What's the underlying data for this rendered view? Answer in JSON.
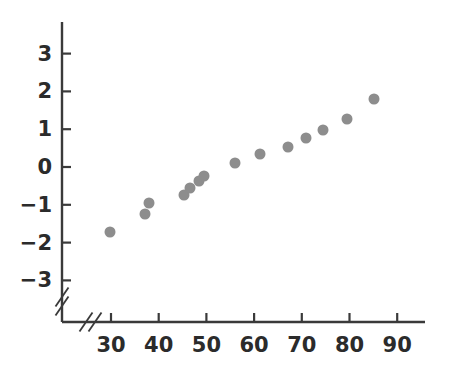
{
  "chart_data": {
    "type": "scatter",
    "title": "",
    "subtitle": "",
    "xlabel": "",
    "ylabel": "",
    "xlim": [
      26,
      94
    ],
    "ylim": [
      -3.4,
      3.4
    ],
    "xticks": [
      30,
      40,
      50,
      60,
      70,
      80,
      90
    ],
    "xtick_labels": [
      "30",
      "40",
      "50",
      "60",
      "70",
      "80",
      "90"
    ],
    "yticks": [
      3,
      2,
      1,
      0,
      -1,
      -2,
      -3
    ],
    "ytick_labels": [
      "3",
      "2",
      "1",
      "0",
      "−1",
      "−2",
      "−3"
    ],
    "grid": false,
    "legend": null,
    "axis_break": {
      "x_axis_break": true,
      "y_axis_break": true,
      "style": "double-slash"
    },
    "marker": {
      "shape": "circle",
      "color": "#8d8d8d",
      "size_px": 11
    },
    "series": [
      {
        "name": "observations",
        "points": [
          {
            "x": 29.8,
            "y": -1.72
          },
          {
            "x": 37.1,
            "y": -1.24
          },
          {
            "x": 38.0,
            "y": -0.95
          },
          {
            "x": 45.3,
            "y": -0.74
          },
          {
            "x": 46.6,
            "y": -0.56
          },
          {
            "x": 48.4,
            "y": -0.37
          },
          {
            "x": 49.5,
            "y": -0.24
          },
          {
            "x": 56.0,
            "y": 0.11
          },
          {
            "x": 61.2,
            "y": 0.34
          },
          {
            "x": 67.1,
            "y": 0.53
          },
          {
            "x": 70.9,
            "y": 0.77
          },
          {
            "x": 74.5,
            "y": 0.98
          },
          {
            "x": 79.5,
            "y": 1.27
          },
          {
            "x": 85.1,
            "y": 1.8
          }
        ]
      }
    ]
  },
  "style": {
    "axis_color": "#3a3a3a",
    "tick_label_color": "#2b2b2b",
    "background": "#ffffff",
    "marker_color": "#8d8d8d"
  },
  "geometry": {
    "x_origin_px": 62,
    "y_origin_px": 322,
    "x_axis_end_px": 425,
    "y_axis_top_px": 22,
    "x_tick30_px": 111,
    "x_unit_px": 4.77,
    "y_zero_px": 167,
    "y_unit_px": 37.8
  }
}
